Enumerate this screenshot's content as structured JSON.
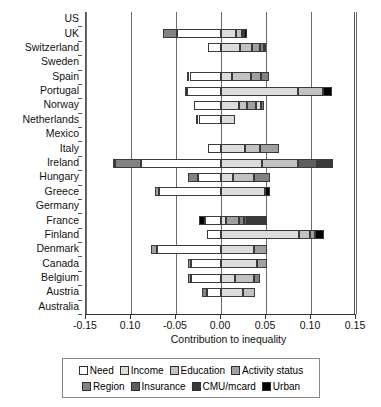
{
  "chart_data": {
    "type": "bar",
    "orientation": "horizontal-stacked-diverging",
    "title": "",
    "xlabel": "Contribution to inequality",
    "ylabel": "",
    "xlim": [
      -0.15,
      0.15
    ],
    "xticks": [
      -0.15,
      -0.1,
      -0.05,
      0.0,
      0.05,
      0.1,
      0.15
    ],
    "xticklabels": [
      "-0.15",
      "0.10",
      "-0.05",
      "0.00",
      "0.05",
      "0.10",
      "0.15"
    ],
    "grid": true,
    "legend_position": "below-axes",
    "series": [
      {
        "name": "Need",
        "color": "#ffffff"
      },
      {
        "name": "Income",
        "color": "#dcdcdc"
      },
      {
        "name": "Education",
        "color": "#c2c2c2"
      },
      {
        "name": "Activity status",
        "color": "#a0a0a0"
      },
      {
        "name": "Region",
        "color": "#828282"
      },
      {
        "name": "Insurance",
        "color": "#5e5e5e"
      },
      {
        "name": "CMU/mcard",
        "color": "#3a3a3a"
      },
      {
        "name": "Urban",
        "color": "#000000"
      }
    ],
    "categories": [
      "US",
      "UK",
      "Switzerland",
      "Sweden",
      "Spain",
      "Portugal",
      "Norway",
      "Netherlands",
      "Mexico",
      "Italy",
      "Ireland",
      "Hungary",
      "Greece",
      "Germany",
      "France",
      "Finland",
      "Denmark",
      "Canada",
      "Belgium",
      "Austria",
      "Australia"
    ],
    "bars": [
      {
        "country": "US",
        "segments": []
      },
      {
        "country": "UK",
        "segments": [
          {
            "series": "Region",
            "from": -0.064,
            "to": -0.049
          },
          {
            "series": "Need",
            "from": -0.049,
            "to": 0.0
          },
          {
            "series": "Income",
            "from": 0.0,
            "to": 0.017
          },
          {
            "series": "Education",
            "from": 0.017,
            "to": 0.023
          },
          {
            "series": "Activity status",
            "from": 0.023,
            "to": 0.0255
          },
          {
            "series": "Urban",
            "from": 0.0255,
            "to": 0.029
          }
        ]
      },
      {
        "country": "Switzerland",
        "segments": [
          {
            "series": "Need",
            "from": -0.014,
            "to": 0.0
          },
          {
            "series": "Income",
            "from": 0.0,
            "to": 0.0215
          },
          {
            "series": "Education",
            "from": 0.0215,
            "to": 0.034
          },
          {
            "series": "Activity status",
            "from": 0.034,
            "to": 0.043
          },
          {
            "series": "Region",
            "from": 0.043,
            "to": 0.048
          },
          {
            "series": "Urban",
            "from": 0.048,
            "to": 0.0505
          }
        ]
      },
      {
        "country": "Sweden",
        "segments": []
      },
      {
        "country": "Spain",
        "segments": [
          {
            "series": "Activity status",
            "from": -0.038,
            "to": -0.035
          },
          {
            "series": "Need",
            "from": -0.035,
            "to": 0.0
          },
          {
            "series": "Income",
            "from": 0.0,
            "to": 0.012
          },
          {
            "series": "Education",
            "from": 0.012,
            "to": 0.033
          },
          {
            "series": "Activity status",
            "from": 0.033,
            "to": 0.0445
          },
          {
            "series": "Region",
            "from": 0.0445,
            "to": 0.0535
          }
        ]
      },
      {
        "country": "Portugal",
        "segments": [
          {
            "series": "Activity status",
            "from": -0.0405,
            "to": -0.0375
          },
          {
            "series": "Need",
            "from": -0.0375,
            "to": 0.0
          },
          {
            "series": "Income",
            "from": 0.0,
            "to": 0.086
          },
          {
            "series": "Education",
            "from": 0.086,
            "to": 0.113
          },
          {
            "series": "Urban",
            "from": 0.113,
            "to": 0.123
          }
        ]
      },
      {
        "country": "Norway",
        "segments": [
          {
            "series": "Need",
            "from": -0.03,
            "to": 0.0
          },
          {
            "series": "Income",
            "from": 0.0,
            "to": 0.02
          },
          {
            "series": "Education",
            "from": 0.02,
            "to": 0.029
          },
          {
            "series": "Activity status",
            "from": 0.029,
            "to": 0.039
          },
          {
            "series": "Income",
            "from": 0.039,
            "to": 0.044
          },
          {
            "series": "Region",
            "from": 0.044,
            "to": 0.048
          }
        ]
      },
      {
        "country": "Netherlands",
        "segments": [
          {
            "series": "Activity status",
            "from": -0.028,
            "to": -0.025
          },
          {
            "series": "Need",
            "from": -0.025,
            "to": 0.0
          },
          {
            "series": "Income",
            "from": 0.0,
            "to": 0.0155
          }
        ]
      },
      {
        "country": "Mexico",
        "segments": []
      },
      {
        "country": "Italy",
        "segments": [
          {
            "series": "Need",
            "from": -0.014,
            "to": 0.0
          },
          {
            "series": "Income",
            "from": 0.0,
            "to": 0.027
          },
          {
            "series": "Education",
            "from": 0.027,
            "to": 0.043
          },
          {
            "series": "Activity status",
            "from": 0.043,
            "to": 0.064
          }
        ]
      },
      {
        "country": "Ireland",
        "segments": [
          {
            "series": "Insurance",
            "from": -0.12,
            "to": -0.1175
          },
          {
            "series": "Region",
            "from": -0.1175,
            "to": -0.089
          },
          {
            "series": "Need",
            "from": -0.089,
            "to": 0.0
          },
          {
            "series": "Income",
            "from": 0.0,
            "to": 0.045
          },
          {
            "series": "Education",
            "from": 0.045,
            "to": 0.085
          },
          {
            "series": "Insurance",
            "from": 0.085,
            "to": 0.107
          },
          {
            "series": "CMU/mcard",
            "from": 0.107,
            "to": 0.125
          }
        ]
      },
      {
        "country": "Hungary",
        "segments": [
          {
            "series": "Region",
            "from": -0.037,
            "to": -0.0255
          },
          {
            "series": "Need",
            "from": -0.0255,
            "to": 0.0
          },
          {
            "series": "Income",
            "from": 0.0,
            "to": 0.0135
          },
          {
            "series": "Education",
            "from": 0.0135,
            "to": 0.037
          },
          {
            "series": "Region",
            "from": 0.037,
            "to": 0.054
          }
        ]
      },
      {
        "country": "Greece",
        "segments": [
          {
            "series": "Activity status",
            "from": -0.073,
            "to": -0.069
          },
          {
            "series": "Need",
            "from": -0.069,
            "to": 0.0
          },
          {
            "series": "Income",
            "from": 0.0,
            "to": 0.049
          },
          {
            "series": "Urban",
            "from": 0.049,
            "to": 0.0545
          }
        ]
      },
      {
        "country": "Germany",
        "segments": []
      },
      {
        "country": "France",
        "segments": [
          {
            "series": "Urban",
            "from": -0.025,
            "to": -0.0175
          },
          {
            "series": "Need",
            "from": -0.0175,
            "to": 0.0
          },
          {
            "series": "Income",
            "from": 0.0,
            "to": 0.006
          },
          {
            "series": "Activity status",
            "from": 0.006,
            "to": 0.02
          },
          {
            "series": "Region",
            "from": 0.02,
            "to": 0.025
          },
          {
            "series": "Insurance",
            "from": 0.025,
            "to": 0.0285
          },
          {
            "series": "CMU/mcard",
            "from": 0.0285,
            "to": 0.051
          }
        ]
      },
      {
        "country": "Finland",
        "segments": [
          {
            "series": "Need",
            "from": -0.0155,
            "to": 0.0
          },
          {
            "series": "Income",
            "from": 0.0,
            "to": 0.087
          },
          {
            "series": "Education",
            "from": 0.087,
            "to": 0.0985
          },
          {
            "series": "Activity status",
            "from": 0.0985,
            "to": 0.104
          },
          {
            "series": "Urban",
            "from": 0.104,
            "to": 0.115
          }
        ]
      },
      {
        "country": "Denmark",
        "segments": [
          {
            "series": "Activity status",
            "from": -0.0775,
            "to": -0.071
          },
          {
            "series": "Need",
            "from": -0.071,
            "to": 0.0
          },
          {
            "series": "Income",
            "from": 0.0,
            "to": 0.037
          },
          {
            "series": "Activity status",
            "from": 0.037,
            "to": 0.051
          }
        ]
      },
      {
        "country": "Canada",
        "segments": [
          {
            "series": "Activity status",
            "from": -0.037,
            "to": -0.033
          },
          {
            "series": "Need",
            "from": -0.033,
            "to": 0.0
          },
          {
            "series": "Income",
            "from": 0.0,
            "to": 0.0395
          },
          {
            "series": "Activity status",
            "from": 0.0395,
            "to": 0.051
          }
        ]
      },
      {
        "country": "Belgium",
        "segments": [
          {
            "series": "Activity status",
            "from": -0.037,
            "to": -0.033
          },
          {
            "series": "Need",
            "from": -0.033,
            "to": 0.0
          },
          {
            "series": "Income",
            "from": 0.0,
            "to": 0.015
          },
          {
            "series": "Education",
            "from": 0.015,
            "to": 0.037
          },
          {
            "series": "Region",
            "from": 0.037,
            "to": 0.043
          }
        ]
      },
      {
        "country": "Austria",
        "segments": [
          {
            "series": "Region",
            "from": -0.0215,
            "to": -0.016
          },
          {
            "series": "Need",
            "from": -0.016,
            "to": 0.0
          },
          {
            "series": "Income",
            "from": 0.0,
            "to": 0.024
          },
          {
            "series": "Education",
            "from": 0.024,
            "to": 0.0375
          }
        ]
      },
      {
        "country": "Australia",
        "segments": []
      }
    ]
  }
}
